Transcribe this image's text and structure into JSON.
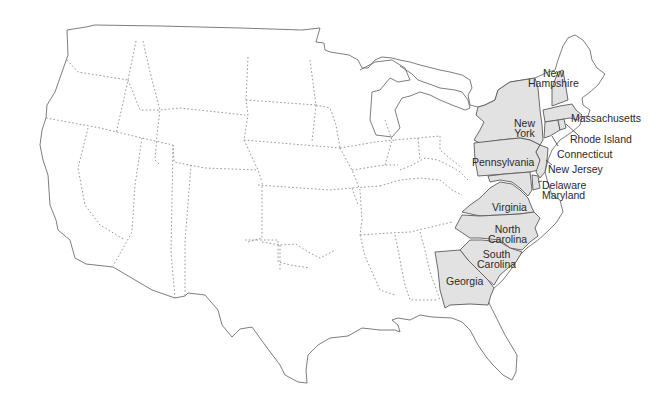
{
  "map": {
    "title": "Thirteen Original Colonies",
    "highlight_color": "#e2e2e2",
    "border_color": "#8a8a8a",
    "coast_color": "#6e6e6e",
    "colonies": [
      {
        "id": "new-hampshire",
        "label_line1": "New",
        "label_line2": "Hampshire"
      },
      {
        "id": "massachusetts",
        "label": "Massachusetts"
      },
      {
        "id": "new-york",
        "label_line1": "New",
        "label_line2": "York"
      },
      {
        "id": "rhode-island",
        "label": "Rhode Island"
      },
      {
        "id": "connecticut",
        "label": "Connecticut"
      },
      {
        "id": "pennsylvania",
        "label": "Pennsylvania"
      },
      {
        "id": "new-jersey",
        "label": "New Jersey"
      },
      {
        "id": "delaware",
        "label": "Delaware"
      },
      {
        "id": "maryland",
        "label": "Maryland"
      },
      {
        "id": "virginia",
        "label": "Virginia"
      },
      {
        "id": "north-carolina",
        "label_line1": "North",
        "label_line2": "Carolina"
      },
      {
        "id": "south-carolina",
        "label_line1": "South",
        "label_line2": "Carolina"
      },
      {
        "id": "georgia",
        "label": "Georgia"
      }
    ]
  }
}
